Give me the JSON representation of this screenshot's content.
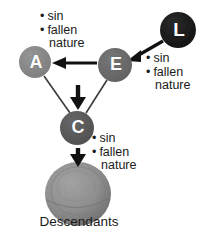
{
  "diagram": {
    "background_color": "#ffffff",
    "nodes": [
      {
        "id": "L",
        "label": "L",
        "color": "#1c1c1c",
        "cx": 178,
        "cy": 30,
        "r": 18
      },
      {
        "id": "A",
        "label": "A",
        "color": "#8d8d8d",
        "cx": 35,
        "cy": 62,
        "r": 16
      },
      {
        "id": "E",
        "label": "E",
        "color": "#6e6e6e",
        "cx": 115,
        "cy": 65,
        "r": 17
      },
      {
        "id": "C",
        "label": "C",
        "color": "#5c5c5c",
        "cx": 77,
        "cy": 128,
        "r": 17
      }
    ],
    "descendants": {
      "label": "Descendants",
      "color": "#8f8f8f",
      "cx": 78,
      "cy": 194,
      "r": 33
    },
    "notes": {
      "top": {
        "bullet": "•",
        "items": [
          "sin",
          "fallen"
        ],
        "continuation": "nature"
      },
      "right": {
        "bullet": "•",
        "items": [
          "sin",
          "fallen"
        ],
        "continuation": "nature"
      },
      "middle": {
        "bullet": "•",
        "items": [
          "sin",
          "fallen"
        ],
        "continuation": "nature"
      }
    },
    "arrows": [
      {
        "name": "arrow-L-to-E",
        "from": "L",
        "to": "E"
      },
      {
        "name": "arrow-E-to-A",
        "from": "E",
        "to": "A"
      },
      {
        "name": "arrow-E-to-C",
        "from": "E",
        "to": "C"
      },
      {
        "name": "arrow-C-to-descendants",
        "from": "C",
        "to": "Descendants"
      }
    ],
    "connectors": [
      {
        "name": "line-A-to-C",
        "from": "A",
        "to": "C"
      },
      {
        "name": "line-E-to-C",
        "from": "E",
        "to": "C"
      }
    ]
  }
}
